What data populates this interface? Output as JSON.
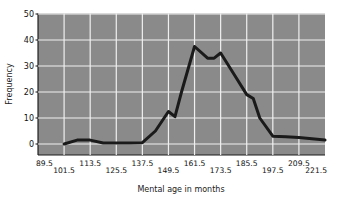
{
  "chart_data": {
    "type": "line",
    "title": "",
    "xlabel": "Mental age in months",
    "ylabel": "Frequency",
    "xtick_labels": [
      "89.5",
      "101.5",
      "113.5",
      "125.5",
      "137.5",
      "149.5",
      "161.5",
      "173.5",
      "185.5",
      "197.5",
      "209.5",
      "221.5"
    ],
    "xtick_values": [
      89.5,
      101.5,
      113.5,
      125.5,
      137.5,
      149.5,
      161.5,
      173.5,
      185.5,
      197.5,
      209.5,
      221.5
    ],
    "ytick_labels": [
      "0",
      "10",
      "20",
      "30",
      "40",
      "50"
    ],
    "ytick_values": [
      0,
      10,
      20,
      30,
      40,
      50
    ],
    "xlim": [
      89.5,
      221.5
    ],
    "ylim": [
      0,
      50
    ],
    "grid": true,
    "legend": false,
    "plot_background": "#8a8a8a",
    "grid_color": "#f0f0f0",
    "line_color": "#1a1a1a",
    "line_width": 3,
    "x": [
      101.5,
      107.5,
      113.5,
      119.5,
      125.5,
      131.5,
      137.5,
      143.5,
      149.5,
      152.5,
      155.5,
      161.5,
      167.5,
      170.5,
      173.5,
      179.5,
      185.5,
      188.5,
      191.5,
      197.5,
      203.5,
      209.5,
      215.5,
      221.5
    ],
    "y": [
      0,
      1.5,
      1.5,
      0.4,
      0.4,
      0.4,
      0.5,
      5,
      12.5,
      10.5,
      20,
      37.5,
      33,
      33,
      35,
      27,
      19,
      17.5,
      10,
      3,
      2.8,
      2.5,
      2,
      1.5
    ],
    "series": [
      {
        "name": "Frequency",
        "points": [
          {
            "x": 101.5,
            "y": 0
          },
          {
            "x": 107.5,
            "y": 1.5
          },
          {
            "x": 113.5,
            "y": 1.5
          },
          {
            "x": 119.5,
            "y": 0.4
          },
          {
            "x": 125.5,
            "y": 0.4
          },
          {
            "x": 131.5,
            "y": 0.4
          },
          {
            "x": 137.5,
            "y": 0.5
          },
          {
            "x": 143.5,
            "y": 5
          },
          {
            "x": 149.5,
            "y": 12.5
          },
          {
            "x": 152.5,
            "y": 10.5
          },
          {
            "x": 155.5,
            "y": 20
          },
          {
            "x": 161.5,
            "y": 37.5
          },
          {
            "x": 167.5,
            "y": 33
          },
          {
            "x": 170.5,
            "y": 33
          },
          {
            "x": 173.5,
            "y": 35
          },
          {
            "x": 179.5,
            "y": 27
          },
          {
            "x": 185.5,
            "y": 19
          },
          {
            "x": 188.5,
            "y": 17.5
          },
          {
            "x": 191.5,
            "y": 10
          },
          {
            "x": 197.5,
            "y": 3
          },
          {
            "x": 203.5,
            "y": 2.8
          },
          {
            "x": 209.5,
            "y": 2.5
          },
          {
            "x": 215.5,
            "y": 2
          },
          {
            "x": 221.5,
            "y": 1.5
          }
        ]
      }
    ]
  }
}
